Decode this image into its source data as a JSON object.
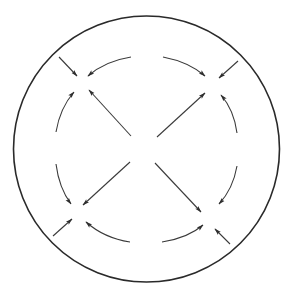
{
  "diagram": {
    "colors": {
      "stroke": "#3a3a3a",
      "circle": "#2a2a2a",
      "background": "#ffffff"
    },
    "outer_circle": {
      "cx": 146.5,
      "cy": 149,
      "r": 133
    },
    "convergence_points": [
      {
        "name": "upper-left",
        "x": 80,
        "y": 80
      },
      {
        "name": "upper-right",
        "x": 212,
        "y": 80
      },
      {
        "name": "lower-left",
        "x": 78,
        "y": 212
      },
      {
        "name": "lower-right",
        "x": 210,
        "y": 218
      }
    ],
    "arrows": {
      "diagonals": [
        {
          "name": "center-to-upper-left",
          "from": [
            131,
            136
          ],
          "to": [
            89,
            90
          ]
        },
        {
          "name": "center-to-upper-right",
          "from": [
            157,
            137
          ],
          "to": [
            205,
            93
          ]
        },
        {
          "name": "center-to-lower-left",
          "from": [
            130,
            162
          ],
          "to": [
            83,
            205
          ]
        },
        {
          "name": "center-to-lower-right",
          "from": [
            155,
            163
          ],
          "to": [
            201,
            212
          ]
        }
      ],
      "arcs": [
        {
          "name": "top-left-arc",
          "path": "M131,57 Q105,61 88,76"
        },
        {
          "name": "top-right-arc",
          "path": "M163,57 Q189,62 205,76"
        },
        {
          "name": "left-upper-arc",
          "path": "M56,132 Q60,108 74,92"
        },
        {
          "name": "left-lower-arc",
          "path": "M56,164 Q59,188 71,204"
        },
        {
          "name": "right-upper-arc",
          "path": "M237,133 Q234,110 221,95"
        },
        {
          "name": "right-lower-arc",
          "path": "M237,166 Q233,189 219,204"
        },
        {
          "name": "bottom-left-arc",
          "path": "M130,242 Q104,238 86,222"
        },
        {
          "name": "bottom-right-arc",
          "path": "M162,242 Q188,238 203,225"
        }
      ],
      "radial_inward": [
        {
          "name": "inward-upper-left",
          "from": [
            59,
            57
          ],
          "to": [
            77,
            76
          ]
        },
        {
          "name": "inward-upper-right",
          "from": [
            238,
            61
          ],
          "to": [
            219,
            78
          ]
        },
        {
          "name": "inward-lower-left",
          "from": [
            53,
            236
          ],
          "to": [
            72,
            219
          ]
        },
        {
          "name": "inward-lower-right",
          "from": [
            230,
            244
          ],
          "to": [
            215,
            229
          ]
        }
      ]
    },
    "labels": {
      "title": "Four-cell flow pattern"
    }
  }
}
